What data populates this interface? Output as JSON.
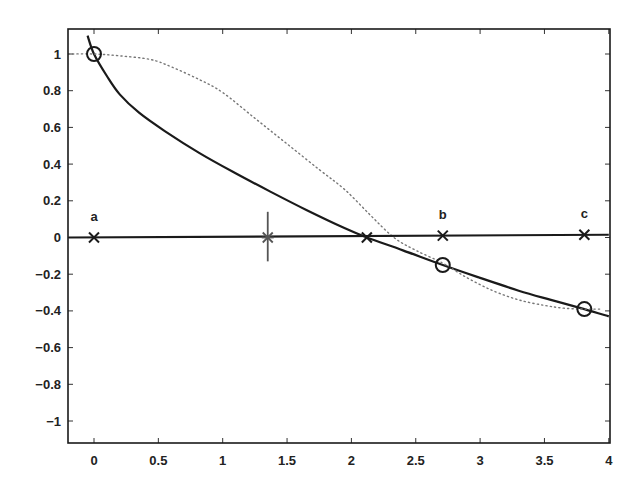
{
  "chart_data": {
    "type": "line",
    "title": "",
    "xlabel": "",
    "ylabel": "",
    "xlim": [
      -0.2,
      4
    ],
    "ylim": [
      -1.12,
      1.1
    ],
    "grid": false,
    "legend": null,
    "x_ticks": [
      0,
      0.5,
      1,
      1.5,
      2,
      2.5,
      3,
      3.5,
      4
    ],
    "x_tick_labels": [
      "0",
      "0.5",
      "1",
      "1.5",
      "2",
      "2.5",
      "3",
      "3.5",
      "4"
    ],
    "y_ticks": [
      1,
      0.8,
      0.6,
      0.4,
      0.2,
      0,
      -0.2,
      -0.4,
      -0.6,
      -0.8,
      -1
    ],
    "y_tick_labels": [
      "1",
      "0.8",
      "0.6",
      "0.4",
      "0.2",
      "0",
      "-0.2",
      "-0.4",
      "-0.6",
      "-0.8",
      "-1"
    ],
    "series": [
      {
        "name": "solid-curve",
        "style": "solid",
        "color": "#1a1a1a",
        "x": [
          -0.05,
          0,
          0.1,
          0.2,
          0.35,
          0.55,
          0.82,
          1.1,
          1.37,
          1.65,
          1.95,
          2.12,
          2.4,
          2.71,
          3.0,
          3.3,
          3.55,
          3.81,
          4.0
        ],
        "y": [
          1.1,
          1.0,
          0.88,
          0.78,
          0.68,
          0.58,
          0.46,
          0.35,
          0.25,
          0.15,
          0.05,
          0.0,
          -0.07,
          -0.15,
          -0.22,
          -0.29,
          -0.34,
          -0.39,
          -0.43
        ]
      },
      {
        "name": "dotted-curve",
        "style": "dotted",
        "color": "#777777",
        "x": [
          -0.2,
          0,
          0.2,
          0.44,
          0.6,
          0.82,
          1.0,
          1.25,
          1.5,
          1.75,
          1.95,
          2.15,
          2.33,
          2.5,
          2.71,
          2.9,
          3.1,
          3.3,
          3.5,
          3.65,
          3.81,
          3.95
        ],
        "y": [
          1.0,
          1.0,
          0.99,
          0.97,
          0.93,
          0.86,
          0.79,
          0.65,
          0.51,
          0.37,
          0.26,
          0.12,
          0.0,
          -0.07,
          -0.14,
          -0.22,
          -0.29,
          -0.34,
          -0.37,
          -0.385,
          -0.39,
          -0.39
        ]
      },
      {
        "name": "zero-line",
        "style": "solid",
        "color": "#1a1a1a",
        "x": [
          -0.2,
          4.0
        ],
        "y": [
          0.0,
          0.015
        ]
      }
    ],
    "markers": [
      {
        "type": "x",
        "x": 0.0,
        "y": 0.0,
        "label": "a"
      },
      {
        "type": "star-with-bar",
        "x": 1.35,
        "y": 0.0,
        "bar_ymin": -0.13,
        "bar_ymax": 0.14,
        "label": ""
      },
      {
        "type": "x",
        "x": 2.12,
        "y": 0.0,
        "label": ""
      },
      {
        "type": "x",
        "x": 2.71,
        "y": 0.01,
        "label": "b"
      },
      {
        "type": "x",
        "x": 3.81,
        "y": 0.015,
        "label": "c"
      },
      {
        "type": "circle",
        "x": 0.0,
        "y": 1.0
      },
      {
        "type": "circle",
        "x": 2.71,
        "y": -0.15
      },
      {
        "type": "circle",
        "x": 3.81,
        "y": -0.39
      }
    ]
  }
}
